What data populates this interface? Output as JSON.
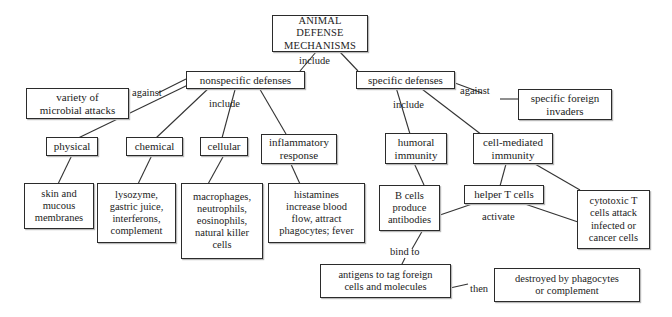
{
  "diagram": {
    "title": "ANIMAL DEFENSE MECHANISMS",
    "nodes": {
      "root": "ANIMAL DEFENSE\nMECHANISMS",
      "root_l1": "ANIMAL DEFENSE",
      "root_l2": "MECHANISMS",
      "nonspecific": "nonspecific defenses",
      "specific": "specific defenses",
      "microbial": "variety of\nmicrobial attacks",
      "microbial_l1": "variety of",
      "microbial_l2": "microbial attacks",
      "foreign": "specific foreign\ninvaders",
      "foreign_l1": "specific foreign",
      "foreign_l2": "invaders",
      "physical": "physical",
      "chemical": "chemical",
      "cellular": "cellular",
      "inflammatory_l1": "inflammatory",
      "inflammatory_l2": "response",
      "skin_l1": "skin and",
      "skin_l2": "mucous",
      "skin_l3": "membranes",
      "lyso_l1": "lysozyme,",
      "lyso_l2": "gastric juice,",
      "lyso_l3": "interferons,",
      "lyso_l4": "complement",
      "macro_l1": "macrophages,",
      "macro_l2": "neutrophils,",
      "macro_l3": "eosinophils,",
      "macro_l4": "natural killer",
      "macro_l5": "cells",
      "hist_l1": "histamines",
      "hist_l2": "increase blood",
      "hist_l3": "flow, attract",
      "hist_l4": "phagocytes; fever",
      "humoral_l1": "humoral",
      "humoral_l2": "immunity",
      "cellmed_l1": "cell-mediated",
      "cellmed_l2": "immunity",
      "bcells_l1": "B cells",
      "bcells_l2": "produce",
      "bcells_l3": "antibodies",
      "helper": "helper T cells",
      "cytotoxic_l1": "cytotoxic T",
      "cytotoxic_l2": "cells attack",
      "cytotoxic_l3": "infected or",
      "cytotoxic_l4": "cancer cells",
      "antigens_l1": "antigens to tag foreign",
      "antigens_l2": "cells and molecules",
      "destroyed_l1": "destroyed by phagocytes",
      "destroyed_l2": "or complement"
    },
    "edge_labels": {
      "include_root": "include",
      "against_left": "against",
      "include_nonspecific": "include",
      "include_specific": "include",
      "against_right": "against",
      "activate": "activate",
      "bind_to": "bind to",
      "then": "then"
    },
    "colors": {
      "border": "#2b2b2b",
      "shadow": "#b9b9b9",
      "text": "#1c1c1c",
      "background": "#ffffff",
      "edge": "#333333"
    }
  }
}
